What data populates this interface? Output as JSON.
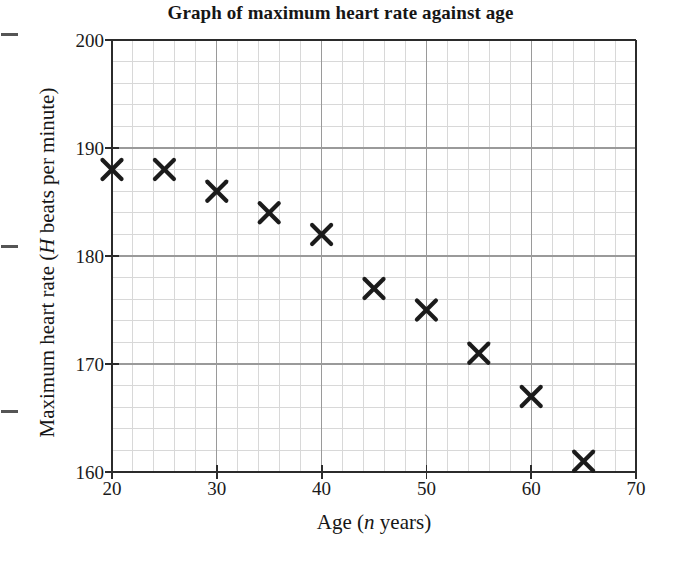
{
  "chart_data": {
    "type": "scatter",
    "title": "Graph of maximum heart rate against age",
    "xlabel": "Age (n years)",
    "xlabel_prefix": "Age (",
    "xlabel_variable": "n",
    "xlabel_suffix": " years)",
    "ylabel": "Maximum heart rate (H beats per minute)",
    "ylabel_prefix": "Maximum heart rate (",
    "ylabel_variable": "H",
    "ylabel_suffix": " beats per minute)",
    "xlim": [
      20,
      70
    ],
    "ylim": [
      160,
      200
    ],
    "xticks": [
      20,
      30,
      40,
      50,
      60,
      70
    ],
    "yticks": [
      160,
      170,
      180,
      190,
      200
    ],
    "x_major_step": 10,
    "y_major_step": 10,
    "x_minor_divisions": 5,
    "y_minor_divisions": 5,
    "grid": true,
    "legend": false,
    "marker": "x-cross",
    "marker_color": "#1b1b1b",
    "x": [
      20,
      25,
      30,
      35,
      40,
      45,
      50,
      55,
      60,
      65
    ],
    "y": [
      188,
      188,
      186,
      184,
      182,
      177,
      175,
      171,
      167,
      161
    ],
    "points": [
      {
        "age": 20,
        "heart_rate": 188
      },
      {
        "age": 25,
        "heart_rate": 188
      },
      {
        "age": 30,
        "heart_rate": 186
      },
      {
        "age": 35,
        "heart_rate": 184
      },
      {
        "age": 40,
        "heart_rate": 182
      },
      {
        "age": 45,
        "heart_rate": 177
      },
      {
        "age": 50,
        "heart_rate": 175
      },
      {
        "age": 55,
        "heart_rate": 171
      },
      {
        "age": 60,
        "heart_rate": 167
      },
      {
        "age": 65,
        "heart_rate": 161
      }
    ]
  },
  "colors": {
    "axis": "#2b2b2b",
    "major_grid": "#9a9a9a",
    "minor_grid": "#d8d8d8",
    "marker": "#1b1b1b",
    "text": "#1a1a1a",
    "background": "#ffffff"
  }
}
